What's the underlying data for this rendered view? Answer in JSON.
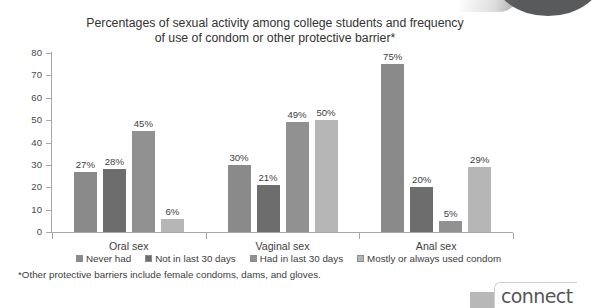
{
  "chart_data": {
    "type": "bar",
    "title": "Percentages of sexual activity among college students and frequency\nof use of condom or other protective barrier*",
    "title_line1": "Percentages of sexual activity among college students and frequency",
    "title_line2": "of use of condom or other protective barrier*",
    "xlabel": "",
    "ylabel": "",
    "ylim": [
      0,
      80
    ],
    "yticks": [
      0,
      10,
      20,
      30,
      40,
      50,
      60,
      70,
      80
    ],
    "ytick_labels": [
      "0",
      "10",
      "20",
      "30",
      "40",
      "50",
      "60",
      "70",
      "80"
    ],
    "grid": false,
    "legend_position": "bottom",
    "categories": [
      "Oral sex",
      "Vaginal sex",
      "Anal sex"
    ],
    "series": [
      {
        "name": "Never had",
        "color": "#8a8a8a",
        "values": [
          27,
          30,
          75
        ],
        "labels": [
          "27%",
          "30%",
          "75%"
        ]
      },
      {
        "name": "Not in last 30 days",
        "color": "#6d6d6d",
        "values": [
          28,
          21,
          20
        ],
        "labels": [
          "28%",
          "21%",
          "20%"
        ]
      },
      {
        "name": "Had in last 30 days",
        "color": "#919191",
        "values": [
          45,
          49,
          5
        ],
        "labels": [
          "45%",
          "49%",
          "5%"
        ]
      },
      {
        "name": "Mostly or always used condom",
        "color": "#b6b6b6",
        "values": [
          6,
          50,
          29
        ],
        "labels": [
          "6%",
          "50%",
          "29%"
        ]
      }
    ],
    "footnote": "*Other protective barriers include female condoms, dams, and gloves."
  },
  "branding": {
    "logo_text": "connect"
  }
}
